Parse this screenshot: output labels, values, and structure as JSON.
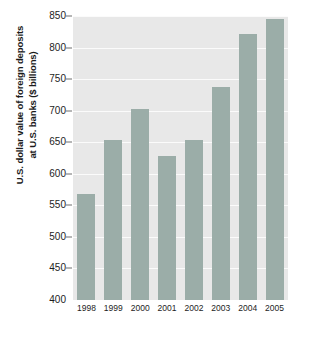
{
  "chart_data": {
    "type": "bar",
    "title": "",
    "xlabel": "",
    "ylabel": "U.S. dollar value of foreign deposits at U.S. banks ($ billions)",
    "ylabel_lines": [
      "U.S. dollar value of foreign deposits",
      "at U.S. banks ($ billions)"
    ],
    "categories": [
      "1998",
      "1999",
      "2000",
      "2001",
      "2002",
      "2003",
      "2004",
      "2005"
    ],
    "values": [
      568,
      653,
      703,
      628,
      653,
      738,
      822,
      845
    ],
    "ylim": [
      400,
      850
    ],
    "ytick_values": [
      400,
      450,
      500,
      550,
      600,
      650,
      700,
      750,
      800,
      850
    ],
    "ytick_labels": [
      "400",
      "450",
      "500",
      "550",
      "600",
      "650",
      "700",
      "750",
      "800",
      "850"
    ],
    "grid": true,
    "legend": null,
    "bar_color": "#9bada8",
    "plot_background": "#e8e8e8",
    "gridline_color": "#fbfbfb",
    "figure_background": "#ffffff",
    "text_color": "#1d1d1d"
  }
}
